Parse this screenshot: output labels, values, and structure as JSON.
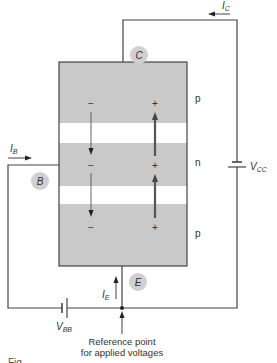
{
  "diagram": {
    "colors": {
      "region_fill": "#c9c9c9",
      "junction_fill": "#ffffff",
      "wire": "#444444",
      "terminal_circle": "#d0d0d0",
      "text": "#333333"
    },
    "regions": [
      {
        "id": "collector-region",
        "label": "p"
      },
      {
        "id": "base-region",
        "label": "n"
      },
      {
        "id": "emitter-region",
        "label": "p"
      }
    ],
    "terminals": {
      "collector": "C",
      "base": "B",
      "emitter": "E"
    },
    "currents": {
      "collector": {
        "symbol": "I",
        "sub": "C"
      },
      "base": {
        "symbol": "I",
        "sub": "B"
      },
      "emitter": {
        "symbol": "I",
        "sub": "E"
      }
    },
    "sources": {
      "vcc": {
        "symbol": "V",
        "sub": "CC"
      },
      "vbb": {
        "symbol": "V",
        "sub": "BB"
      }
    },
    "charges": {
      "minus": "−",
      "plus": "+"
    },
    "reference": {
      "line1": "Reference point",
      "line2": "for applied voltages"
    },
    "caption": "Fig."
  }
}
